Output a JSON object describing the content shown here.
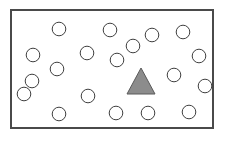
{
  "figure": {
    "name": "visual-search-array",
    "frame": {
      "x": 10,
      "y": 9,
      "width": 204,
      "height": 120,
      "stroke_color": "#4a4a4a",
      "stroke_width": 2,
      "fill_color": "#ffffff"
    },
    "background_color": "#ffffff"
  },
  "shapes": {
    "circle_style": {
      "radius": 6.8,
      "stroke_color": "#3f3f3f",
      "stroke_width": 1,
      "fill_color": "#ffffff"
    },
    "triangle_style": {
      "stroke_color": "#5a5a5a",
      "stroke_width": 1,
      "fill_color": "#8c8c8c"
    },
    "circle_count": 19,
    "triangle_count": 1,
    "circles": [
      {
        "id": "circle-1",
        "cx": 59,
        "cy": 29
      },
      {
        "id": "circle-2",
        "cx": 110,
        "cy": 30
      },
      {
        "id": "circle-3",
        "cx": 152,
        "cy": 35
      },
      {
        "id": "circle-4",
        "cx": 183,
        "cy": 32
      },
      {
        "id": "circle-5",
        "cx": 33,
        "cy": 55
      },
      {
        "id": "circle-6",
        "cx": 87,
        "cy": 53
      },
      {
        "id": "circle-7",
        "cx": 117,
        "cy": 60
      },
      {
        "id": "circle-8",
        "cx": 199,
        "cy": 56
      },
      {
        "id": "circle-9",
        "cx": 57,
        "cy": 69
      },
      {
        "id": "circle-10",
        "cx": 174,
        "cy": 75
      },
      {
        "id": "circle-11",
        "cx": 32,
        "cy": 81
      },
      {
        "id": "circle-12",
        "cx": 88,
        "cy": 96
      },
      {
        "id": "circle-13",
        "cx": 59,
        "cy": 114
      },
      {
        "id": "circle-14",
        "cx": 116,
        "cy": 113
      },
      {
        "id": "circle-15",
        "cx": 148,
        "cy": 113
      },
      {
        "id": "circle-16",
        "cx": 189,
        "cy": 112
      },
      {
        "id": "circle-17",
        "cx": 205,
        "cy": 86
      },
      {
        "id": "circle-18",
        "cx": 24,
        "cy": 94
      },
      {
        "id": "circle-19",
        "cx": 133,
        "cy": 46
      }
    ],
    "triangle": {
      "id": "triangle-target",
      "apex_x": 141,
      "apex_y": 68,
      "base_left_x": 127,
      "base_right_x": 155,
      "base_y": 94
    }
  },
  "chart_data": {
    "type": "scatter",
    "title": "",
    "xlabel": "",
    "ylabel": "",
    "xlim": [
      10,
      214
    ],
    "ylim": [
      9,
      129
    ],
    "grid": false,
    "legend": null,
    "series": [
      {
        "name": "circles",
        "marker": "circle",
        "fill": "#ffffff",
        "edge": "#3f3f3f",
        "x": [
          59,
          110,
          152,
          183,
          33,
          87,
          117,
          199,
          57,
          174,
          32,
          88,
          59,
          116,
          148,
          189,
          205,
          24,
          133
        ],
        "y": [
          29,
          30,
          35,
          32,
          55,
          53,
          60,
          56,
          69,
          75,
          81,
          96,
          114,
          113,
          113,
          112,
          86,
          94,
          46
        ]
      },
      {
        "name": "triangle",
        "marker": "triangle-up",
        "fill": "#8c8c8c",
        "edge": "#5a5a5a",
        "x": [
          141
        ],
        "y": [
          82
        ]
      }
    ]
  }
}
